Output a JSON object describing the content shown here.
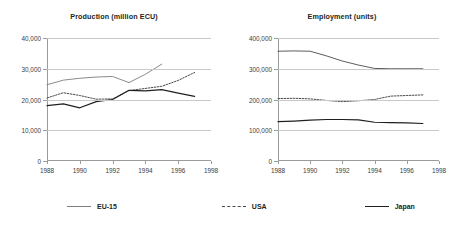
{
  "legend": {
    "items": [
      {
        "key": "eu",
        "label": "EU-15",
        "style": "solid",
        "color": "#7d7d7d"
      },
      {
        "key": "usa",
        "label": "USA",
        "style": "dashed",
        "color": "#4a4a4a"
      },
      {
        "key": "japan",
        "label": "Japan",
        "style": "solid",
        "color": "#231f20"
      }
    ]
  },
  "chart_data": [
    {
      "type": "line",
      "title": "Production (million ECU)",
      "xlabel": "",
      "ylabel": "",
      "xlim": [
        1988,
        1998
      ],
      "ylim": [
        0,
        40000
      ],
      "xticks": [
        1988,
        1990,
        1992,
        1994,
        1996,
        1998
      ],
      "xtick_labels": [
        "1988",
        "1990",
        "1992",
        "1994",
        "1996",
        "1998"
      ],
      "yticks": [
        0,
        10000,
        20000,
        30000,
        40000
      ],
      "ytick_labels": [
        "0",
        "10,000",
        "20,000",
        "30,000",
        "40,000"
      ],
      "grid": "horizontal",
      "legend_position": "bottom",
      "series": [
        {
          "name": "EU-15",
          "style": "solid",
          "color": "#7d7d7d",
          "x": [
            1988,
            1989,
            1990,
            1991,
            1992,
            1993,
            1994,
            1995
          ],
          "values": [
            24800,
            26300,
            26900,
            27300,
            27500,
            25500,
            28200,
            31500
          ]
        },
        {
          "name": "USA",
          "style": "dashed",
          "color": "#4a4a4a",
          "x": [
            1988,
            1989,
            1990,
            1991,
            1992,
            1993,
            1994,
            1995,
            1996,
            1997
          ],
          "values": [
            20500,
            22200,
            21300,
            20100,
            20200,
            22900,
            23600,
            24300,
            26200,
            28800
          ]
        },
        {
          "name": "Japan",
          "style": "solid",
          "color": "#231f20",
          "x": [
            1988,
            1989,
            1990,
            1991,
            1992,
            1993,
            1994,
            1995,
            1996,
            1997
          ],
          "values": [
            18000,
            18600,
            17300,
            19300,
            20000,
            23000,
            22800,
            23200,
            22100,
            21000
          ]
        }
      ]
    },
    {
      "type": "line",
      "title": "Employment (units)",
      "xlabel": "",
      "ylabel": "",
      "xlim": [
        1988,
        1998
      ],
      "ylim": [
        0,
        400000
      ],
      "xticks": [
        1988,
        1990,
        1992,
        1994,
        1996,
        1998
      ],
      "xtick_labels": [
        "1988",
        "1990",
        "1992",
        "1994",
        "1996",
        "1998"
      ],
      "yticks": [
        0,
        100000,
        200000,
        300000,
        400000
      ],
      "ytick_labels": [
        "0",
        "100,000",
        "200,000",
        "300,000",
        "400,000"
      ],
      "grid": "horizontal",
      "legend_position": "bottom",
      "series": [
        {
          "name": "EU-15",
          "style": "solid",
          "color": "#4a4a4a",
          "x": [
            1988,
            1989,
            1990,
            1991,
            1992,
            1993,
            1994,
            1995,
            1996,
            1997
          ],
          "values": [
            357000,
            358000,
            357000,
            342000,
            325000,
            312000,
            301000,
            300000,
            300000,
            300000
          ]
        },
        {
          "name": "USA",
          "style": "dashed",
          "color": "#4a4a4a",
          "x": [
            1988,
            1989,
            1990,
            1991,
            1992,
            1993,
            1994,
            1995,
            1996,
            1997
          ],
          "values": [
            203000,
            204000,
            202000,
            197000,
            193000,
            196000,
            200000,
            211000,
            213000,
            215000
          ]
        },
        {
          "name": "Japan",
          "style": "solid",
          "color": "#231f20",
          "x": [
            1988,
            1989,
            1990,
            1991,
            1992,
            1993,
            1994,
            1995,
            1996,
            1997
          ],
          "values": [
            128000,
            130000,
            133000,
            135000,
            135000,
            134000,
            126000,
            125000,
            124000,
            122000
          ]
        }
      ]
    }
  ]
}
